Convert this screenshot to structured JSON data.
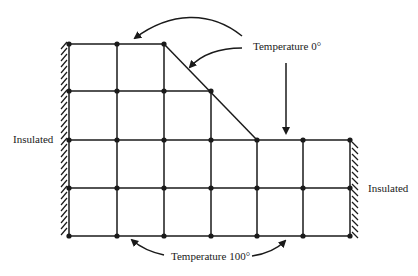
{
  "labels": {
    "top_boundary": "Temperature 0°",
    "bottom_boundary": "Temperature 100°",
    "left_boundary": "Insulated",
    "right_boundary": "Insulated"
  },
  "grid": {
    "columns_x": [
      69,
      117,
      164,
      211,
      257,
      303,
      350
    ],
    "rows_y": [
      44,
      91,
      140,
      188,
      236
    ],
    "description": "Finite-difference mesh on a stepped region with a diagonal edge from (164,44) to (257,140)"
  },
  "colors": {
    "line": "#1a1a1a",
    "background": "#ffffff"
  }
}
